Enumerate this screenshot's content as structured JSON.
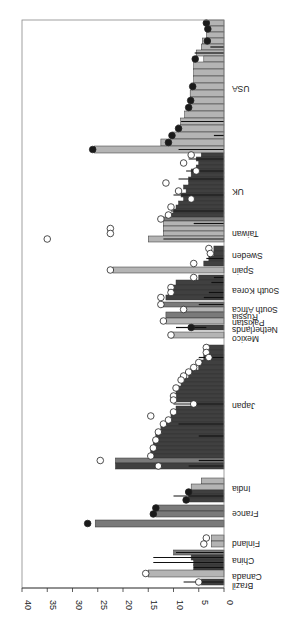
{
  "chart_data": {
    "type": "bar",
    "orientation": "horizontal-rotated",
    "title": "",
    "xlabel": "",
    "ylabel": "",
    "ylim": [
      0,
      40
    ],
    "yticks": [
      0,
      5,
      10,
      15,
      20,
      25,
      30,
      35,
      40
    ],
    "grid": false,
    "colors": {
      "light": "#b4b4b4",
      "medium": "#7a7a7a",
      "dark": "#404040",
      "ci": "#111111",
      "axis": "#333333"
    },
    "countries": [
      {
        "name": "Brazil",
        "pos": 585
      },
      {
        "name": "Canada",
        "pos": 576
      },
      {
        "name": "China",
        "pos": 560
      },
      {
        "name": "Finland",
        "pos": 543
      },
      {
        "name": "France",
        "pos": 513
      },
      {
        "name": "India",
        "pos": 488
      },
      {
        "name": "Japan",
        "pos": 405
      },
      {
        "name": "Mexico",
        "pos": 338
      },
      {
        "name": "Netherlands",
        "pos": 329
      },
      {
        "name": "Pakistan",
        "pos": 322
      },
      {
        "name": "Russia",
        "pos": 316
      },
      {
        "name": "South Africa",
        "pos": 309
      },
      {
        "name": "South Korea",
        "pos": 290
      },
      {
        "name": "Spain",
        "pos": 270
      },
      {
        "name": "Sweden",
        "pos": 255
      },
      {
        "name": "Taiwan",
        "pos": 233
      },
      {
        "name": "UK",
        "pos": 191
      },
      {
        "name": "USA",
        "pos": 88
      }
    ],
    "bars": [
      {
        "y": 20,
        "h": 6,
        "v": 3.0,
        "c": "light",
        "m": "dark",
        "mv": 3.5
      },
      {
        "y": 26,
        "h": 6,
        "v": 3.3,
        "c": "light",
        "m": "dark",
        "mv": 3.2
      },
      {
        "y": 32,
        "h": 6,
        "v": 3.5,
        "c": "light"
      },
      {
        "y": 38,
        "h": 6,
        "v": 4.3,
        "c": "light",
        "m": "dark",
        "mv": 3.3
      },
      {
        "y": 44,
        "h": 6,
        "v": 4.5,
        "c": "light",
        "ci": [
          0,
          2.7
        ]
      },
      {
        "y": 50,
        "h": 6,
        "v": 5.5,
        "c": "light",
        "ci": [
          0,
          5.8
        ]
      },
      {
        "y": 56,
        "h": 6,
        "v": 4.0,
        "c": "light",
        "m": "dark",
        "mv": 5.7
      },
      {
        "y": 62,
        "h": 7,
        "v": 6.0,
        "c": "light"
      },
      {
        "y": 69,
        "h": 7,
        "v": 6.0,
        "c": "light"
      },
      {
        "y": 76,
        "h": 7,
        "v": 6.0,
        "c": "light"
      },
      {
        "y": 83,
        "h": 7,
        "v": 6.5,
        "c": "light",
        "m": "dark",
        "mv": 6.2
      },
      {
        "y": 90,
        "h": 7,
        "v": 6.7,
        "c": "light"
      },
      {
        "y": 97,
        "h": 7,
        "v": 6.7,
        "c": "light",
        "m": "dark",
        "mv": 6.6
      },
      {
        "y": 104,
        "h": 7,
        "v": 7.0,
        "c": "light",
        "m": "dark",
        "mv": 7.0
      },
      {
        "y": 111,
        "h": 7,
        "v": 7.8,
        "c": "light"
      },
      {
        "y": 118,
        "h": 7,
        "v": 8.6,
        "c": "light",
        "ci": [
          0,
          8.5
        ]
      },
      {
        "y": 125,
        "h": 7,
        "v": 9.2,
        "c": "light",
        "m": "dark",
        "mv": 9.0
      },
      {
        "y": 132,
        "h": 7,
        "v": 10.3,
        "c": "light",
        "ci": [
          0,
          2.0
        ],
        "m": "dark",
        "mv": 10.3
      },
      {
        "y": 139,
        "h": 7,
        "v": 12.5,
        "c": "light",
        "m": "dark",
        "mv": 11.0
      },
      {
        "y": 146,
        "h": 7,
        "v": 25.7,
        "c": "light",
        "ci": [
          0,
          9.0
        ],
        "m": "dark",
        "mv": 26.0
      },
      {
        "y": 153,
        "h": 4,
        "v": 4.5,
        "c": "dark",
        "m": "light",
        "mv": 6.5
      },
      {
        "y": 157,
        "h": 4,
        "v": 5.5,
        "c": "dark",
        "ci": [
          0,
          7.0
        ]
      },
      {
        "y": 161,
        "h": 4,
        "v": 5.0,
        "c": "dark",
        "m": "light",
        "mv": 8.0
      },
      {
        "y": 165,
        "h": 4,
        "v": 5.5,
        "c": "dark"
      },
      {
        "y": 169,
        "h": 4,
        "v": 6.5,
        "c": "dark",
        "ci": [
          0,
          7.5
        ],
        "m": "light",
        "mv": 5.5
      },
      {
        "y": 173,
        "h": 4,
        "v": 6.5,
        "c": "dark"
      },
      {
        "y": 177,
        "h": 4,
        "v": 7.0,
        "c": "dark",
        "ci": [
          0,
          9.0
        ]
      },
      {
        "y": 181,
        "h": 4,
        "v": 7.0,
        "c": "dark",
        "m": "light",
        "mv": 11.5
      },
      {
        "y": 185,
        "h": 4,
        "v": 8.0,
        "c": "dark"
      },
      {
        "y": 189,
        "h": 4,
        "v": 7.5,
        "c": "dark",
        "m": "light",
        "mv": 9.0
      },
      {
        "y": 193,
        "h": 4,
        "v": 8.5,
        "c": "dark",
        "ci": [
          0,
          10.0
        ]
      },
      {
        "y": 197,
        "h": 4,
        "v": 8.0,
        "c": "dark",
        "m": "light",
        "mv": 6.5
      },
      {
        "y": 201,
        "h": 4,
        "v": 9.0,
        "c": "dark"
      },
      {
        "y": 205,
        "h": 4,
        "v": 9.5,
        "c": "dark",
        "m": "light",
        "mv": 10.5
      },
      {
        "y": 209,
        "h": 4,
        "v": 10.0,
        "c": "dark",
        "ci": [
          0,
          10.5
        ]
      },
      {
        "y": 213,
        "h": 4,
        "v": 11.0,
        "c": "dark",
        "m": "light",
        "mv": 11.0
      },
      {
        "y": 217,
        "h": 4,
        "v": 12.5,
        "c": "medium",
        "m": "light",
        "mv": 12.5
      },
      {
        "y": 221,
        "h": 5,
        "v": 12.0,
        "c": "light",
        "ci": [
          0,
          6.0
        ]
      },
      {
        "y": 226,
        "h": 5,
        "v": 12.0,
        "c": "light",
        "m": "light",
        "mv": 22.5
      },
      {
        "y": 231,
        "h": 5,
        "v": 12.0,
        "c": "light",
        "m": "light",
        "mv": 22.5
      },
      {
        "y": 236,
        "h": 6,
        "v": 15.0,
        "c": "light",
        "ci": [
          0,
          12.0
        ],
        "m": "light",
        "mv": 35.0
      },
      {
        "y": 246,
        "h": 5,
        "v": 2.0,
        "c": "dark",
        "m": "light",
        "mv": 3.0
      },
      {
        "y": 251,
        "h": 5,
        "v": 2.0,
        "c": "dark",
        "m": "light",
        "mv": 2.7
      },
      {
        "y": 256,
        "h": 5,
        "v": 3.0,
        "c": "dark",
        "ci": [
          0,
          3.5
        ]
      },
      {
        "y": 261,
        "h": 5,
        "v": 4.0,
        "c": "dark",
        "m": "light",
        "mv": 6.0
      },
      {
        "y": 267,
        "h": 6,
        "v": 22.0,
        "c": "light",
        "m": "light",
        "mv": 22.5
      },
      {
        "y": 275,
        "h": 5,
        "v": 5.0,
        "c": "dark",
        "ci": [
          0,
          2.0
        ],
        "m": "light",
        "mv": 6.0
      },
      {
        "y": 280,
        "h": 5,
        "v": 9.5,
        "c": "dark",
        "ci": [
          0,
          2.5
        ]
      },
      {
        "y": 285,
        "h": 5,
        "v": 10.5,
        "c": "dark",
        "m": "light",
        "mv": 10.5
      },
      {
        "y": 290,
        "h": 5,
        "v": 11.0,
        "c": "dark",
        "ci": [
          0,
          3.0
        ],
        "m": "light",
        "mv": 10.5
      },
      {
        "y": 295,
        "h": 5,
        "v": 11.5,
        "c": "dark",
        "ci": [
          0,
          4.0
        ],
        "m": "light",
        "mv": 12.5
      },
      {
        "y": 302,
        "h": 5,
        "v": 12.0,
        "c": "medium",
        "ci": [
          0,
          5.0
        ],
        "m": "light",
        "mv": 12.5
      },
      {
        "y": 307,
        "h": 5,
        "v": 7.5,
        "c": "light",
        "m": "light",
        "mv": 8.0
      },
      {
        "y": 312,
        "h": 6,
        "v": 11.5,
        "c": "medium"
      },
      {
        "y": 318,
        "h": 6,
        "v": 11.5,
        "c": "light",
        "m": "light",
        "mv": 12.0
      },
      {
        "y": 325,
        "h": 5,
        "v": 6.5,
        "c": "dark",
        "ci": [
          3.5,
          9.5
        ],
        "m": "dark",
        "mv": 6.5
      },
      {
        "y": 332,
        "h": 6,
        "v": 10.5,
        "c": "light",
        "m": "light",
        "mv": 10.5
      },
      {
        "y": 345,
        "h": 5,
        "v": 3.5,
        "c": "dark",
        "m": "light",
        "mv": 3.5
      },
      {
        "y": 350,
        "h": 5,
        "v": 3.5,
        "c": "dark",
        "m": "light",
        "mv": 3.5
      },
      {
        "y": 355,
        "h": 5,
        "v": 4.0,
        "c": "dark",
        "ci": [
          0,
          5.0
        ],
        "m": "light",
        "mv": 3.0
      },
      {
        "y": 360,
        "h": 5,
        "v": 4.5,
        "c": "dark",
        "m": "light",
        "mv": 5.0
      },
      {
        "y": 365,
        "h": 5,
        "v": 5.0,
        "c": "dark",
        "m": "light",
        "mv": 6.0
      },
      {
        "y": 370,
        "h": 4,
        "v": 6.5,
        "c": "dark",
        "m": "light",
        "mv": 7.0
      },
      {
        "y": 374,
        "h": 4,
        "v": 7.0,
        "c": "dark",
        "m": "light",
        "mv": 8.0
      },
      {
        "y": 378,
        "h": 4,
        "v": 8.0,
        "c": "dark",
        "m": "light",
        "mv": 8.5
      },
      {
        "y": 382,
        "h": 4,
        "v": 8.5,
        "c": "dark"
      },
      {
        "y": 386,
        "h": 4,
        "v": 9.0,
        "c": "dark",
        "m": "light",
        "mv": 9.5
      },
      {
        "y": 390,
        "h": 4,
        "v": 9.5,
        "c": "dark"
      },
      {
        "y": 394,
        "h": 4,
        "v": 10.0,
        "c": "dark",
        "m": "light",
        "mv": 10.0
      },
      {
        "y": 398,
        "h": 4,
        "v": 10.0,
        "c": "dark",
        "m": "light",
        "mv": 10.0
      },
      {
        "y": 402,
        "h": 4,
        "v": 6.0,
        "c": "dark",
        "ci": [
          0,
          10.0
        ],
        "m": "light",
        "mv": 6.0
      },
      {
        "y": 406,
        "h": 4,
        "v": 9.5,
        "c": "dark"
      },
      {
        "y": 410,
        "h": 4,
        "v": 10.0,
        "c": "dark",
        "m": "light",
        "mv": 10.0
      },
      {
        "y": 414,
        "h": 4,
        "v": 10.5,
        "c": "dark",
        "m": "light",
        "mv": 14.5
      },
      {
        "y": 418,
        "h": 4,
        "v": 11.0,
        "c": "dark",
        "m": "light",
        "mv": 11.0
      },
      {
        "y": 422,
        "h": 4,
        "v": 12.0,
        "c": "dark",
        "ci": [
          0,
          9.0
        ],
        "m": "light",
        "mv": 12.0
      },
      {
        "y": 426,
        "h": 4,
        "v": 12.5,
        "c": "dark"
      },
      {
        "y": 430,
        "h": 4,
        "v": 13.0,
        "c": "dark",
        "m": "light",
        "mv": 13.0
      },
      {
        "y": 434,
        "h": 4,
        "v": 13.5,
        "c": "dark",
        "ci": [
          0,
          5.0
        ]
      },
      {
        "y": 438,
        "h": 4,
        "v": 13.5,
        "c": "dark",
        "m": "light",
        "mv": 13.5
      },
      {
        "y": 442,
        "h": 4,
        "v": 14.0,
        "c": "dark"
      },
      {
        "y": 446,
        "h": 4,
        "v": 14.0,
        "c": "dark",
        "m": "light",
        "mv": 14.0
      },
      {
        "y": 450,
        "h": 4,
        "v": 14.5,
        "c": "dark"
      },
      {
        "y": 454,
        "h": 4,
        "v": 14.5,
        "c": "dark",
        "m": "light",
        "mv": 14.5
      },
      {
        "y": 458,
        "h": 5,
        "v": 21.5,
        "c": "medium",
        "ci": [
          0,
          5.0
        ],
        "m": "light",
        "mv": 24.5
      },
      {
        "y": 463,
        "h": 6,
        "v": 21.5,
        "c": "dark",
        "ci": [
          0,
          7.0
        ],
        "m": "light",
        "mv": 13.0
      },
      {
        "y": 478,
        "h": 6,
        "v": 4.5,
        "c": "light"
      },
      {
        "y": 484,
        "h": 6,
        "v": 6.5,
        "c": "light"
      },
      {
        "y": 490,
        "h": 4,
        "v": 7.0,
        "c": "dark",
        "m": "dark",
        "mv": 7.0
      },
      {
        "y": 494,
        "h": 4,
        "v": 7.0,
        "c": "dark",
        "ci": [
          0,
          10.0
        ]
      },
      {
        "y": 498,
        "h": 4,
        "v": 7.5,
        "c": "dark",
        "m": "dark",
        "mv": 7.5
      },
      {
        "y": 505,
        "h": 6,
        "v": 13.5,
        "c": "medium",
        "m": "dark",
        "mv": 13.5
      },
      {
        "y": 511,
        "h": 6,
        "v": 13.5,
        "c": "medium",
        "m": "dark",
        "mv": 14.0
      },
      {
        "y": 520,
        "h": 7,
        "v": 25.5,
        "c": "medium",
        "m": "dark",
        "mv": 27.0
      },
      {
        "y": 535,
        "h": 6,
        "v": 2.5,
        "c": "light",
        "m": "light",
        "mv": 3.5
      },
      {
        "y": 541,
        "h": 6,
        "v": 2.5,
        "c": "light",
        "m": "light",
        "mv": 4.0
      },
      {
        "y": 550,
        "h": 5,
        "v": 10.0,
        "c": "medium",
        "ci": [
          0,
          9.5
        ]
      },
      {
        "y": 555,
        "h": 5,
        "v": 6.5,
        "c": "dark",
        "ci": [
          0,
          14.0
        ]
      },
      {
        "y": 560,
        "h": 5,
        "v": 6.0,
        "c": "dark",
        "ci": [
          0,
          14.0
        ]
      },
      {
        "y": 565,
        "h": 5,
        "v": 6.0,
        "c": "dark",
        "ci": [
          0,
          6.0
        ]
      },
      {
        "y": 570,
        "h": 7,
        "v": 15.0,
        "c": "light",
        "m": "light",
        "mv": 15.5
      },
      {
        "y": 579,
        "h": 6,
        "v": 4.5,
        "c": "dark",
        "ci": [
          0,
          8.0
        ],
        "m": "light",
        "mv": 5.0
      }
    ]
  }
}
